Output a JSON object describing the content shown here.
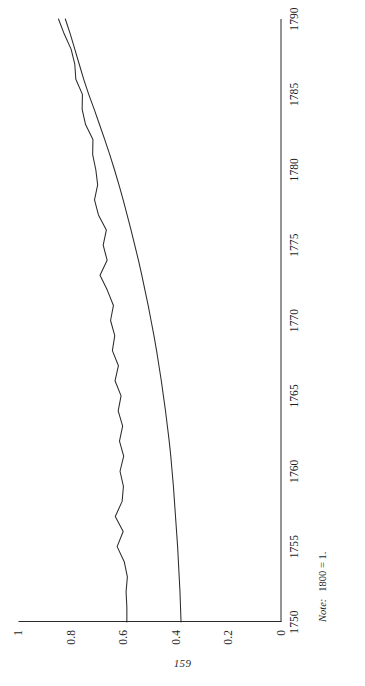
{
  "page": {
    "folio": "159",
    "background_color": "#ffffff",
    "ink_color": "#2b2b2b",
    "orientation": "landscape-figure-rotated-90-ccw"
  },
  "note": {
    "label": "Note:",
    "text": "1800 = 1."
  },
  "axes": {
    "x_ticks": [
      "1750",
      "1755",
      "1760",
      "1765",
      "1770",
      "1775",
      "1780",
      "1785",
      "1790"
    ],
    "y_ticks": [
      "0",
      "0.2",
      "0.4",
      "0.6",
      "0.8",
      "1"
    ]
  },
  "chart_data": {
    "type": "line",
    "title": "",
    "subtitle": "",
    "xlabel": "",
    "ylabel": "",
    "xlim": [
      1750,
      1790
    ],
    "ylim": [
      0,
      1
    ],
    "grid": false,
    "legend": "none",
    "note": "1800 = 1.",
    "x_tick_values": [
      1750,
      1755,
      1760,
      1765,
      1770,
      1775,
      1780,
      1785,
      1790
    ],
    "y_tick_values": [
      0,
      0.2,
      0.4,
      0.6,
      0.8,
      1
    ],
    "x": [
      1750,
      1751,
      1752,
      1753,
      1754,
      1755,
      1756,
      1757,
      1758,
      1759,
      1760,
      1761,
      1762,
      1763,
      1764,
      1765,
      1766,
      1767,
      1768,
      1769,
      1770,
      1771,
      1772,
      1773,
      1774,
      1775,
      1776,
      1777,
      1778,
      1779,
      1780,
      1781,
      1782,
      1783,
      1784,
      1785,
      1786,
      1787,
      1788,
      1789,
      1790
    ],
    "series": [
      {
        "name": "volatile-series",
        "style": "jagged thin line, upper curve",
        "values": [
          0.588,
          0.588,
          0.591,
          0.586,
          0.598,
          0.625,
          0.602,
          0.632,
          0.606,
          0.601,
          0.614,
          0.6,
          0.616,
          0.604,
          0.621,
          0.61,
          0.633,
          0.62,
          0.643,
          0.634,
          0.65,
          0.639,
          0.662,
          0.69,
          0.663,
          0.678,
          0.666,
          0.696,
          0.711,
          0.699,
          0.706,
          0.718,
          0.717,
          0.745,
          0.758,
          0.757,
          0.782,
          0.786,
          0.8,
          0.826,
          0.848
        ]
      },
      {
        "name": "smooth-series",
        "style": "smooth thin line, lower curve",
        "values": [
          0.382,
          0.384,
          0.386,
          0.389,
          0.392,
          0.395,
          0.399,
          0.403,
          0.407,
          0.411,
          0.416,
          0.421,
          0.427,
          0.434,
          0.441,
          0.449,
          0.457,
          0.466,
          0.475,
          0.485,
          0.496,
          0.507,
          0.519,
          0.531,
          0.544,
          0.558,
          0.572,
          0.587,
          0.602,
          0.618,
          0.635,
          0.653,
          0.672,
          0.692,
          0.712,
          0.733,
          0.752,
          0.769,
          0.786,
          0.803,
          0.822
        ]
      }
    ]
  }
}
